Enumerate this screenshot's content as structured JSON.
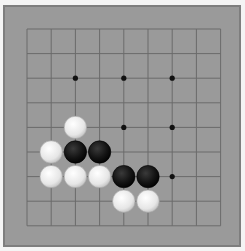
{
  "game": {
    "type": "go-board",
    "size": 9,
    "colors": {
      "board": "#9a9a9a",
      "border": "#7e7e7e",
      "line": "#6b6b6b",
      "star": "#111111",
      "black_stone": "#141414",
      "white_stone": "#e6e6e6"
    },
    "star_points": [
      [
        2,
        2
      ],
      [
        4,
        2
      ],
      [
        6,
        2
      ],
      [
        4,
        4
      ],
      [
        6,
        4
      ],
      [
        6,
        6
      ]
    ],
    "stones": [
      {
        "color": "white",
        "col": 2,
        "row": 4
      },
      {
        "color": "white",
        "col": 1,
        "row": 5
      },
      {
        "color": "black",
        "col": 2,
        "row": 5
      },
      {
        "color": "black",
        "col": 3,
        "row": 5
      },
      {
        "color": "white",
        "col": 1,
        "row": 6
      },
      {
        "color": "white",
        "col": 2,
        "row": 6
      },
      {
        "color": "white",
        "col": 3,
        "row": 6
      },
      {
        "color": "black",
        "col": 4,
        "row": 6
      },
      {
        "color": "black",
        "col": 5,
        "row": 6
      },
      {
        "color": "white",
        "col": 4,
        "row": 7
      },
      {
        "color": "white",
        "col": 5,
        "row": 7
      }
    ]
  }
}
